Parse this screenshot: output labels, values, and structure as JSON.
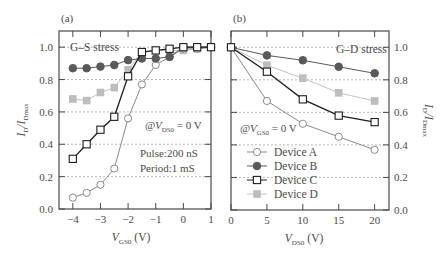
{
  "chart_data": [
    {
      "panel_label": "(a)",
      "type": "line",
      "title": "G–S stress",
      "xlabel": "V_GS0 (V)",
      "xlabel_main": "V",
      "xlabel_sub": "GS0",
      "xlabel_unit": "(V)",
      "ylabel": "I_D/I_Dmax",
      "ylabel_main": "I",
      "ylabel_sub1": "D",
      "ylabel_mid": "/I",
      "ylabel_sub2": "Dmax",
      "xlim": [
        -4.5,
        1
      ],
      "ylim": [
        0,
        1.1
      ],
      "xticks": [
        "-4",
        "-3",
        "-2",
        "-1",
        "0",
        "1"
      ],
      "xtick_values": [
        -4,
        -3,
        -2,
        -1,
        0,
        1
      ],
      "yticks": [
        "0.0",
        "0.2",
        "0.4",
        "0.6",
        "0.8",
        "1.0"
      ],
      "ytick_values": [
        0,
        0.2,
        0.4,
        0.6,
        0.8,
        1.0
      ],
      "grid": "horizontal dashed",
      "annotations": [
        "@V_DS0 = 0 V",
        "Pulse:200 nS",
        "Period:1 mS"
      ],
      "x": [
        -4,
        -3.5,
        -3,
        -2.5,
        -2,
        -1.5,
        -1,
        -0.5,
        0,
        0.5,
        1
      ],
      "series": [
        {
          "name": "Device A",
          "marker": "open-circle",
          "values": [
            0.07,
            0.1,
            0.15,
            0.25,
            0.56,
            0.77,
            0.89,
            0.94,
            0.99,
            0.99,
            1.0
          ]
        },
        {
          "name": "Device B",
          "marker": "filled-circle",
          "values": [
            0.87,
            0.87,
            0.88,
            0.89,
            0.92,
            0.93,
            0.93,
            0.94,
            1.0,
            1.0,
            1.0
          ]
        },
        {
          "name": "Device C",
          "marker": "open-square",
          "values": [
            0.31,
            0.4,
            0.49,
            0.57,
            0.82,
            0.97,
            0.98,
            0.99,
            1.0,
            1.0,
            1.0
          ]
        },
        {
          "name": "Device D",
          "marker": "gray-square",
          "values": [
            0.68,
            0.67,
            0.72,
            0.75,
            0.86,
            0.97,
            0.98,
            0.98,
            0.98,
            0.99,
            1.0
          ]
        }
      ]
    },
    {
      "panel_label": "(b)",
      "type": "line",
      "title": "G–D stress",
      "xlabel": "V_DS0 (V)",
      "xlabel_main": "V",
      "xlabel_sub": "DS0",
      "xlabel_unit": "(V)",
      "ylabel": "I_D/I_Dmax",
      "ylabel_main": "I",
      "ylabel_sub1": "D",
      "ylabel_mid": "/I",
      "ylabel_sub2": "Dmax",
      "xlim": [
        0,
        22
      ],
      "ylim": [
        0,
        1.1
      ],
      "xticks": [
        "0",
        "5",
        "10",
        "15",
        "20"
      ],
      "xtick_values": [
        0,
        5,
        10,
        15,
        20
      ],
      "yticks": [
        "0.0",
        "0.2",
        "0.4",
        "0.6",
        "0.8",
        "1.0"
      ],
      "ytick_values": [
        0,
        0.2,
        0.4,
        0.6,
        0.8,
        1.0
      ],
      "grid": "horizontal dashed",
      "annotations": [
        "@V_GS0 = 0 V"
      ],
      "legend": [
        "Device A",
        "Device B",
        "Device C",
        "Device D"
      ],
      "legend_position": "lower left",
      "x": [
        0,
        5,
        10,
        15,
        20
      ],
      "series": [
        {
          "name": "Device A",
          "marker": "open-circle",
          "values": [
            1.0,
            0.67,
            0.53,
            0.45,
            0.37
          ]
        },
        {
          "name": "Device B",
          "marker": "filled-circle",
          "values": [
            1.0,
            0.95,
            0.92,
            0.88,
            0.84
          ]
        },
        {
          "name": "Device C",
          "marker": "open-square",
          "values": [
            1.0,
            0.85,
            0.68,
            0.58,
            0.54
          ]
        },
        {
          "name": "Device D",
          "marker": "gray-square",
          "values": [
            1.0,
            0.89,
            0.81,
            0.72,
            0.67
          ]
        }
      ]
    }
  ],
  "styles": {
    "Device A": {
      "line": "#8a8a8a",
      "fill": "#ffffff",
      "stroke": "#8a8a8a"
    },
    "Device B": {
      "line": "#5a5a5a",
      "fill": "#5a5a5a",
      "stroke": "#5a5a5a"
    },
    "Device C": {
      "line": "#1e1e1e",
      "fill": "#ffffff",
      "stroke": "#1e1e1e"
    },
    "Device D": {
      "line": "#c4c4c4",
      "fill": "#bdbdbd",
      "stroke": "#bdbdbd"
    },
    "frame": "#4a4a4a",
    "grid": "#9a9a9a"
  },
  "annotation_text": {
    "a_title": "G–S stress",
    "a_at": "@V",
    "a_at_sub": "DS0",
    "a_at_val": " = 0 V",
    "a_pulse": "Pulse:200 nS",
    "a_period": "Period:1 mS",
    "b_title": "G–D stress",
    "b_at": "@V",
    "b_at_sub": "GS0",
    "b_at_val": " = 0 V"
  }
}
